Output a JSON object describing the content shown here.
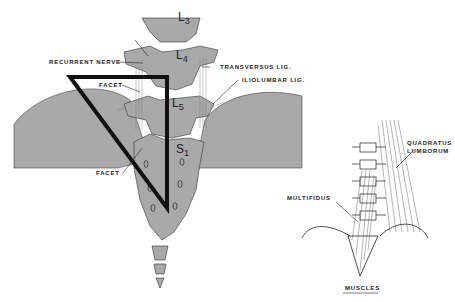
{
  "figure": {
    "left_panel": {
      "vertebra_labels": [
        {
          "main": "L",
          "sub": "3"
        },
        {
          "main": "L",
          "sub": "4"
        },
        {
          "main": "L",
          "sub": "5"
        },
        {
          "main": "S",
          "sub": "1"
        }
      ],
      "annotations": {
        "recurrent_nerve": "RECURRENT NERVE",
        "transversus_lig": "TRANSVERSUS LIG.",
        "iliolumbar_lig": "ILIOLUMBAR LIG.",
        "facet_upper": "FACET",
        "facet_lower": "FACET"
      }
    },
    "right_panel": {
      "annotations": {
        "quadratus_lumborum_line1": "QUADRATUS",
        "quadratus_lumborum_line2": "LUMBORUM",
        "multifidus": "MULTIFIDUS"
      },
      "caption": "MUSCLES"
    },
    "colors": {
      "bone_fill": "#a9a9a9",
      "outline": "#222222",
      "triangle": "#111111",
      "background": "#ffffff"
    }
  }
}
